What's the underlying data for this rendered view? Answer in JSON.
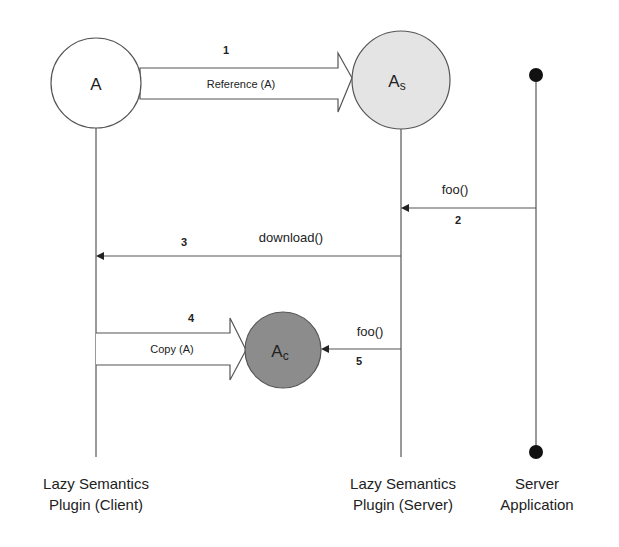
{
  "diagram": {
    "nodes": {
      "a": {
        "label": "A",
        "sub": ""
      },
      "as": {
        "label": "A",
        "sub": "s"
      },
      "ac": {
        "label": "A",
        "sub": "c"
      }
    },
    "arrows": {
      "step1": {
        "number": "1",
        "label": "Reference (A)"
      },
      "step2": {
        "number": "2",
        "label": "foo()"
      },
      "step3": {
        "number": "3",
        "label": "download()"
      },
      "step4": {
        "number": "4",
        "label": "Copy (A)"
      },
      "step5": {
        "number": "5",
        "label": "foo()"
      }
    },
    "lanes": {
      "client": {
        "line1": "Lazy Semantics",
        "line2": "Plugin (Client)"
      },
      "server": {
        "line1": "Lazy Semantics",
        "line2": "Plugin (Server)"
      },
      "app": {
        "line1": "Server",
        "line2": "Application"
      }
    },
    "colors": {
      "stroke": "#555555",
      "node_a_fill": "#ffffff",
      "node_as_fill": "#e4e4e4",
      "node_ac_fill": "#8c8c8c",
      "dot": "#111111"
    }
  }
}
